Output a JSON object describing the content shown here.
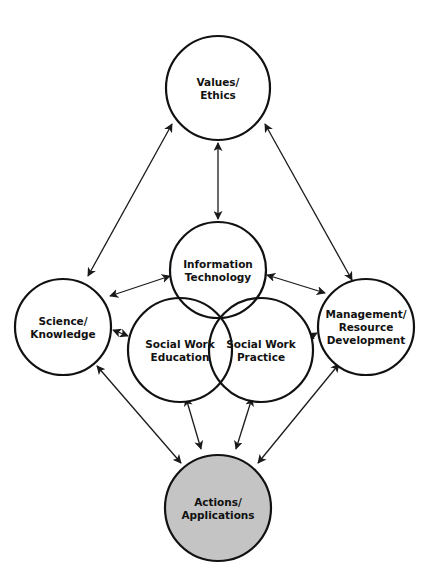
{
  "diagram": {
    "title": "",
    "colors": {
      "stroke": "#111111",
      "node_fill": "#ffffff",
      "highlight_fill": "#c4c4c4",
      "background": "#ffffff"
    },
    "nodes": [
      {
        "id": "values",
        "lines": [
          "Values/",
          "Ethics"
        ],
        "cx": 218,
        "cy": 88,
        "r": 52,
        "fill": "#ffffff"
      },
      {
        "id": "it",
        "lines": [
          "Information",
          "Technology"
        ],
        "cx": 218,
        "cy": 270,
        "r": 48,
        "fill": "none"
      },
      {
        "id": "science",
        "lines": [
          "Science/",
          "Knowledge"
        ],
        "cx": 63,
        "cy": 327,
        "r": 48,
        "fill": "#ffffff"
      },
      {
        "id": "swe",
        "lines": [
          "Social Work",
          "Education"
        ],
        "cx": 180,
        "cy": 350,
        "r": 52,
        "fill": "none"
      },
      {
        "id": "swp",
        "lines": [
          "Social Work",
          "Practice"
        ],
        "cx": 261,
        "cy": 350,
        "r": 52,
        "fill": "none"
      },
      {
        "id": "mgmt",
        "lines": [
          "Management/",
          "Resource",
          "Development"
        ],
        "cx": 366,
        "cy": 327,
        "r": 48,
        "fill": "#ffffff"
      },
      {
        "id": "actions",
        "lines": [
          "Actions/",
          "Applications"
        ],
        "cx": 218,
        "cy": 508,
        "r": 53,
        "fill": "#c4c4c4"
      }
    ],
    "edges": [
      {
        "from": "values",
        "to": "it",
        "x1": 218,
        "y1": 143,
        "x2": 218,
        "y2": 219,
        "start_arrow": true,
        "end_arrow": true
      },
      {
        "from": "values",
        "to": "science",
        "x1": 172,
        "y1": 124,
        "x2": 88,
        "y2": 276,
        "start_arrow": true,
        "end_arrow": true
      },
      {
        "from": "values",
        "to": "mgmt",
        "x1": 265,
        "y1": 124,
        "x2": 352,
        "y2": 280,
        "start_arrow": true,
        "end_arrow": true
      },
      {
        "from": "science",
        "to": "it",
        "x1": 110,
        "y1": 296,
        "x2": 170,
        "y2": 276,
        "start_arrow": true,
        "end_arrow": true
      },
      {
        "from": "mgmt",
        "to": "it",
        "x1": 325,
        "y1": 293,
        "x2": 267,
        "y2": 275,
        "start_arrow": true,
        "end_arrow": true
      },
      {
        "from": "science",
        "to": "swe",
        "x1": 113,
        "y1": 330,
        "x2": 128,
        "y2": 336,
        "start_arrow": true,
        "end_arrow": true
      },
      {
        "from": "mgmt",
        "to": "swp",
        "x1": 317,
        "y1": 333,
        "x2": 306,
        "y2": 339,
        "start_arrow": true,
        "end_arrow": true
      },
      {
        "from": "science",
        "to": "actions",
        "x1": 97,
        "y1": 366,
        "x2": 181,
        "y2": 463,
        "start_arrow": true,
        "end_arrow": true
      },
      {
        "from": "mgmt",
        "to": "actions",
        "x1": 339,
        "y1": 364,
        "x2": 258,
        "y2": 463,
        "start_arrow": true,
        "end_arrow": true
      },
      {
        "from": "swe",
        "to": "actions",
        "x1": 186,
        "y1": 398,
        "x2": 201,
        "y2": 449,
        "start_arrow": true,
        "end_arrow": true
      },
      {
        "from": "swp",
        "to": "actions",
        "x1": 252,
        "y1": 398,
        "x2": 236,
        "y2": 449,
        "start_arrow": true,
        "end_arrow": true
      }
    ]
  }
}
